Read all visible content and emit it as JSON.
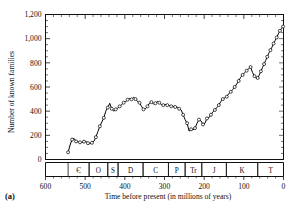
{
  "figure": {
    "panel_label": "(a)",
    "background_color": "#ffffff",
    "line_color": "#000000",
    "marker_fill_color": "#ffffff"
  },
  "chart_data": {
    "type": "line",
    "title": "",
    "xlabel": "Time before present (in millions of years)",
    "ylabel": "Number of known families",
    "xlim": [
      600,
      0
    ],
    "ylim": [
      0,
      1200
    ],
    "x_reversed": true,
    "grid": false,
    "legend": "none",
    "xticks": [
      600,
      500,
      400,
      300,
      200,
      100,
      0
    ],
    "xtick_labels": [
      "600",
      "500",
      "400",
      "300",
      "200",
      "100",
      "0"
    ],
    "x_minor_tick_step": 20,
    "yticks": [
      0,
      200,
      400,
      600,
      800,
      1000,
      1200
    ],
    "ytick_labels": [
      "0",
      "200",
      "400",
      "600",
      "800",
      "1,000",
      "1,200"
    ],
    "y_minor_tick_step": 50,
    "marker": "open-circle",
    "series": [
      {
        "name": "Number of known families",
        "x": [
          543,
          538,
          533,
          528,
          523,
          518,
          513,
          508,
          503,
          498,
          493,
          488,
          483,
          478,
          473,
          468,
          463,
          458,
          453,
          448,
          443,
          438,
          433,
          428,
          423,
          418,
          413,
          408,
          403,
          398,
          393,
          388,
          383,
          378,
          373,
          368,
          363,
          358,
          353,
          348,
          343,
          338,
          333,
          328,
          323,
          318,
          313,
          308,
          303,
          298,
          293,
          288,
          283,
          278,
          273,
          268,
          263,
          258,
          253,
          248,
          243,
          238,
          233,
          228,
          223,
          218,
          213,
          208,
          203,
          198,
          193,
          188,
          183,
          178,
          173,
          168,
          163,
          158,
          153,
          148,
          143,
          138,
          133,
          128,
          123,
          118,
          113,
          108,
          103,
          98,
          93,
          88,
          83,
          78,
          73,
          68,
          65,
          61,
          57,
          53,
          49,
          45,
          41,
          37,
          33,
          29,
          25,
          21,
          17,
          13,
          9,
          5,
          1
        ],
        "y": [
          60,
          120,
          165,
          175,
          150,
          145,
          142,
          140,
          148,
          150,
          135,
          130,
          138,
          150,
          185,
          230,
          275,
          310,
          345,
          400,
          430,
          465,
          420,
          400,
          415,
          425,
          440,
          455,
          470,
          480,
          495,
          505,
          498,
          515,
          500,
          480,
          470,
          440,
          415,
          420,
          440,
          465,
          475,
          460,
          465,
          480,
          470,
          455,
          450,
          455,
          450,
          445,
          440,
          440,
          435,
          430,
          420,
          410,
          370,
          330,
          300,
          235,
          250,
          245,
          260,
          300,
          330,
          320,
          290,
          300,
          340,
          345,
          370,
          395,
          410,
          430,
          450,
          480,
          500,
          510,
          520,
          545,
          560,
          580,
          600,
          625,
          650,
          680,
          700,
          720,
          735,
          750,
          765,
          720,
          690,
          670,
          675,
          700,
          730,
          760,
          790,
          820,
          850,
          880,
          905,
          930,
          960,
          985,
          1010,
          1040,
          1065,
          1085,
          1100
        ]
      }
    ],
    "period_bands": [
      {
        "abbr": "Є",
        "name": "Cambrian",
        "start": 543,
        "end": 490
      },
      {
        "abbr": "O",
        "name": "Ordovician",
        "start": 490,
        "end": 443
      },
      {
        "abbr": "S",
        "name": "Silurian",
        "start": 443,
        "end": 417
      },
      {
        "abbr": "D",
        "name": "Devonian",
        "start": 417,
        "end": 354
      },
      {
        "abbr": "C",
        "name": "Carboniferous",
        "start": 354,
        "end": 290
      },
      {
        "abbr": "P",
        "name": "Permian",
        "start": 290,
        "end": 248
      },
      {
        "abbr": "Tr",
        "name": "Triassic",
        "start": 248,
        "end": 206
      },
      {
        "abbr": "J",
        "name": "Jurassic",
        "start": 206,
        "end": 144
      },
      {
        "abbr": "K",
        "name": "Cretaceous",
        "start": 144,
        "end": 65
      },
      {
        "abbr": "T",
        "name": "Tertiary",
        "start": 65,
        "end": 0
      }
    ]
  }
}
